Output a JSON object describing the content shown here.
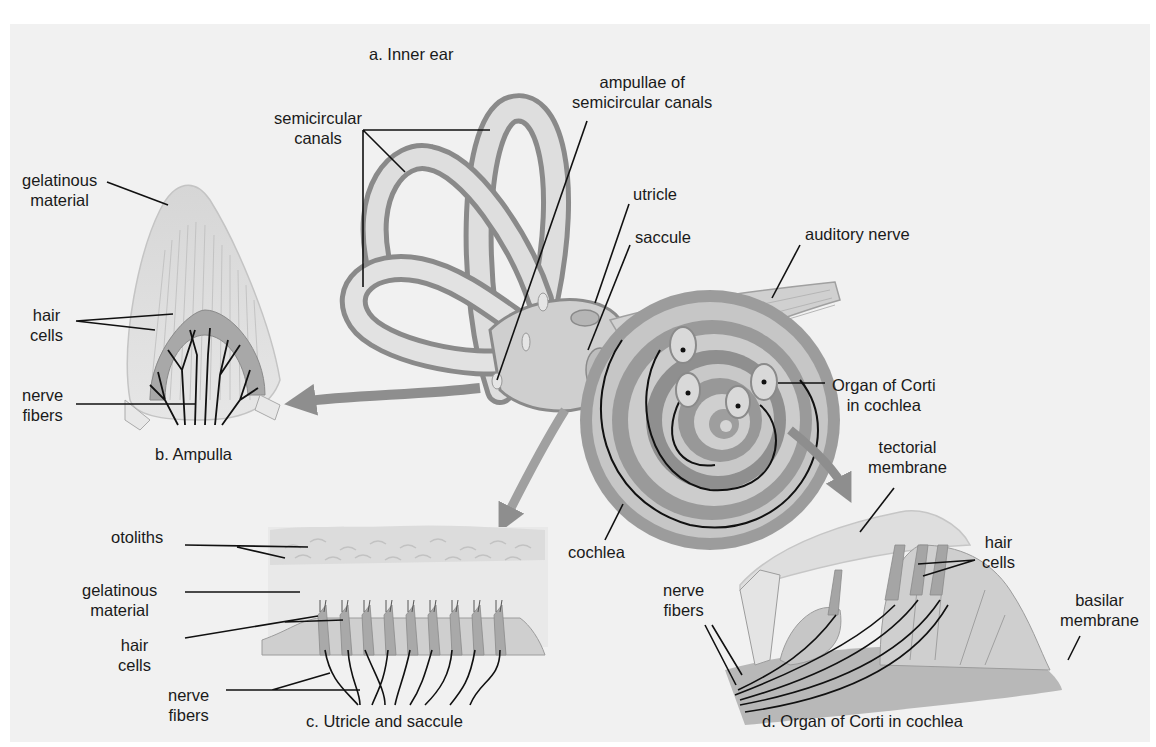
{
  "diagram": {
    "colors": {
      "background": "#f1f1f1",
      "border": "#ffffff",
      "structure_light": "#dcdcdc",
      "structure_mid": "#a9a9a9",
      "structure_dark": "#7d7d7d",
      "arrow": "#8e8e8e",
      "leader_line": "#111111",
      "text": "#1a1a1a"
    },
    "panels": {
      "a": {
        "caption": "a. Inner ear",
        "labels": {
          "semicircular_canals": [
            "semicircular",
            "canals"
          ],
          "ampullae": [
            "ampullae of",
            "semicircular canals"
          ],
          "utricle": "utricle",
          "saccule": "saccule",
          "auditory_nerve": "auditory nerve",
          "organ_of_corti": [
            "Organ of Corti",
            "in cochlea"
          ],
          "cochlea": "cochlea"
        }
      },
      "b": {
        "caption": "b. Ampulla",
        "labels": {
          "gelatinous_material": [
            "gelatinous",
            "material"
          ],
          "hair_cells": [
            "hair",
            "cells"
          ],
          "nerve_fibers": [
            "nerve",
            "fibers"
          ]
        }
      },
      "c": {
        "caption": "c. Utricle and saccule",
        "labels": {
          "otoliths": "otoliths",
          "gelatinous_material": [
            "gelatinous",
            "material"
          ],
          "hair_cells": [
            "hair",
            "cells"
          ],
          "nerve_fibers": [
            "nerve",
            "fibers"
          ]
        }
      },
      "d": {
        "caption": "d. Organ of Corti in cochlea",
        "labels": {
          "tectorial_membrane": [
            "tectorial",
            "membrane"
          ],
          "hair_cells": [
            "hair",
            "cells"
          ],
          "nerve_fibers": [
            "nerve",
            "fibers"
          ],
          "basilar_membrane": [
            "basilar",
            "membrane"
          ]
        }
      }
    }
  }
}
